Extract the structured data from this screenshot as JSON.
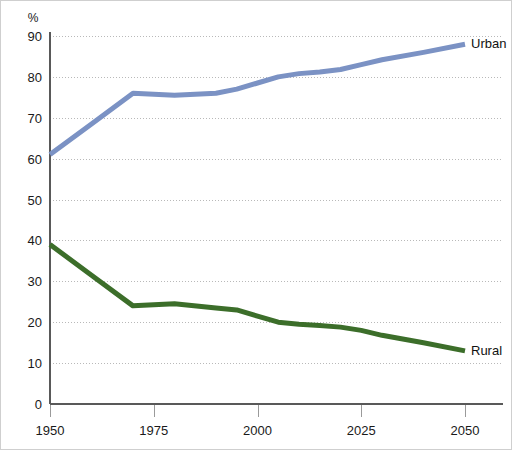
{
  "chart_data": {
    "type": "line",
    "title": "",
    "xlabel": "",
    "ylabel": "%",
    "y_unit_symbol": "%",
    "xlim": [
      1950,
      2050
    ],
    "ylim": [
      0,
      90
    ],
    "grid": true,
    "legend_position": "right-inline-end-of-line",
    "y_ticks": [
      0,
      10,
      20,
      30,
      40,
      50,
      60,
      70,
      80,
      90
    ],
    "y_tick_labels": [
      "0",
      "10",
      "20",
      "30",
      "40",
      "50",
      "60",
      "70",
      "80",
      "90"
    ],
    "x_ticks": [
      1950,
      1975,
      2000,
      2025,
      2050
    ],
    "x_tick_labels": [
      "1950",
      "1975",
      "2000",
      "2025",
      "2050"
    ],
    "series": [
      {
        "name": "Urban",
        "label": "Urban",
        "color": "#7b92c4",
        "x": [
          1950,
          1960,
          1970,
          1980,
          1990,
          1995,
          2000,
          2005,
          2010,
          2015,
          2020,
          2025,
          2030,
          2040,
          2050
        ],
        "values": [
          61,
          68.5,
          76,
          75.5,
          76,
          77,
          78.5,
          80,
          80.8,
          81.2,
          81.8,
          83,
          84.2,
          86,
          88
        ]
      },
      {
        "name": "Rural",
        "label": "Rural",
        "color": "#3c6e2a",
        "x": [
          1950,
          1960,
          1970,
          1980,
          1990,
          1995,
          2000,
          2005,
          2010,
          2015,
          2020,
          2025,
          2030,
          2040,
          2050
        ],
        "values": [
          39,
          31.5,
          24,
          24.5,
          23.5,
          23,
          21.5,
          20,
          19.5,
          19.2,
          18.8,
          18,
          16.8,
          15,
          13
        ]
      }
    ]
  },
  "legend": {
    "urban_label": "Urban",
    "rural_label": "Rural"
  }
}
